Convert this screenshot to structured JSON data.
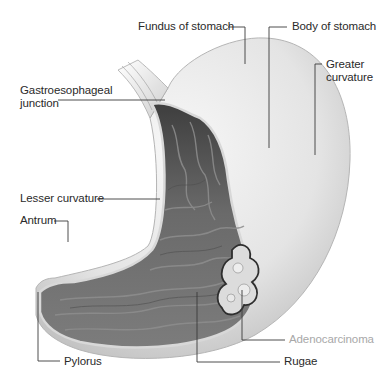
{
  "figure": {
    "colors": {
      "background": "#ffffff",
      "label_text": "#2a2a2a",
      "highlight_label_text": "#a8a8a8",
      "leader_line": "#3a3a3a",
      "outer_wall": "#e6e6e6",
      "interior_mucosa": "#6e6e6e",
      "tumor": "#d9d9d9"
    }
  },
  "labels": {
    "fundus": "Fundus of stomach",
    "body": "Body of stomach",
    "greater_curvature": "Greater\ncurvature",
    "ge_junction": "Gastroesophageal\njunction",
    "lesser_curvature": "Lesser curvature",
    "antrum": "Antrum",
    "pylorus": "Pylorus",
    "rugae": "Rugae",
    "adenocarcinoma": "Adenocarcinoma"
  }
}
